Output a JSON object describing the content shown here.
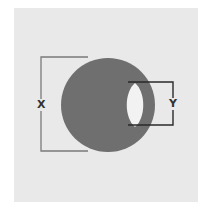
{
  "diagram": {
    "type": "geometric-figure",
    "labels": {
      "x_label": "X",
      "y_label": "Y"
    },
    "colors": {
      "background_panel": "#e9e9e9",
      "disk": "#6f6f6f",
      "bracket_x": "#7a7a7a",
      "bracket_y": "#2a2a2a",
      "cutout": "#f2f2f2"
    }
  }
}
